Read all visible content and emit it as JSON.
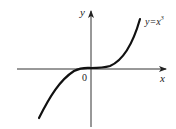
{
  "diagram": {
    "type": "function-graph",
    "function_label": "y=x",
    "function_exponent": "3",
    "x_axis_label": "x",
    "y_axis_label": "y",
    "origin_label": "0",
    "colors": {
      "axis": "#333333",
      "curve": "#111111",
      "background": "#ffffff"
    }
  }
}
